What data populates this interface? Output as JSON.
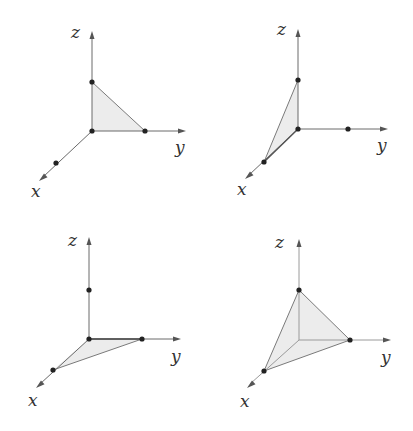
{
  "diagrams": [
    {
      "id": "panel-1",
      "axis_labels": {
        "x": "x",
        "y": "y",
        "z": "z"
      },
      "highlighted_plane": "yz",
      "triangle_vertices": [
        "origin",
        "y-point",
        "z-point"
      ]
    },
    {
      "id": "panel-2",
      "axis_labels": {
        "x": "x",
        "y": "y",
        "z": "z"
      },
      "highlighted_plane": "xz",
      "triangle_vertices": [
        "origin",
        "x-point",
        "z-point"
      ]
    },
    {
      "id": "panel-3",
      "axis_labels": {
        "x": "x",
        "y": "y",
        "z": "z"
      },
      "highlighted_plane": "xy",
      "triangle_vertices": [
        "origin",
        "x-point",
        "y-point"
      ]
    },
    {
      "id": "panel-4",
      "axis_labels": {
        "x": "x",
        "y": "y",
        "z": "z"
      },
      "highlighted_plane": "xyz",
      "triangle_vertices": [
        "x-point",
        "y-point",
        "z-point"
      ]
    }
  ],
  "colors": {
    "face_fill": "#ececec",
    "axis": "#6a6a6a",
    "dot": "#222222"
  }
}
